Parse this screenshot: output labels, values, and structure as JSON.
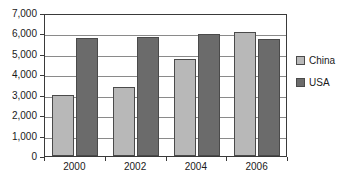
{
  "chart_data": {
    "type": "bar",
    "title": "",
    "subtitle": "",
    "xlabel": "",
    "ylabel": "",
    "categories": [
      "2000",
      "2002",
      "2004",
      "2006"
    ],
    "series": [
      {
        "name": "China",
        "color": "#b8b8b8",
        "values": [
          3000,
          3400,
          4750,
          6050
        ]
      },
      {
        "name": "USA",
        "color": "#6b6b6b",
        "values": [
          5800,
          5820,
          5950,
          5750
        ]
      }
    ],
    "ylim": [
      0,
      7000
    ],
    "ytick_step": 1000,
    "ytick_labels": [
      "0",
      "1,000",
      "2,000",
      "3,000",
      "4,000",
      "5,000",
      "6,000",
      "7,000"
    ],
    "ytick_values": [
      0,
      1000,
      2000,
      3000,
      4000,
      5000,
      6000,
      7000
    ],
    "grid": true,
    "grid_axis": "y",
    "legend": true,
    "legend_position": "right",
    "legend_entries": [
      "China",
      "USA"
    ],
    "annotations": [],
    "plot_border_color": "#3a3a3a",
    "gridline_color": "#8a8a8a",
    "background_color": "#ffffff",
    "bar_border_color": "#4a4a4a"
  }
}
